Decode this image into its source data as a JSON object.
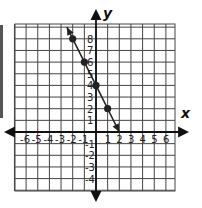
{
  "chart_data": {
    "type": "line",
    "title": "",
    "xlabel": "x",
    "ylabel": "y",
    "xlim": [
      -7,
      7
    ],
    "ylim": [
      -5,
      9
    ],
    "grid": true,
    "x_tick_labels": [
      "-6",
      "-5",
      "-4",
      "-3",
      "-2",
      "-1",
      "1",
      "2",
      "3",
      "4",
      "5",
      "6"
    ],
    "x_ticks": [
      -6,
      -5,
      -4,
      -3,
      -2,
      -1,
      1,
      2,
      3,
      4,
      5,
      6
    ],
    "y_tick_labels": [
      "8",
      "7",
      "6",
      "5",
      "4",
      "3",
      "2",
      "1",
      "-1",
      "-2",
      "-3",
      "-4"
    ],
    "y_ticks": [
      8,
      7,
      6,
      5,
      4,
      3,
      2,
      1,
      -1,
      -2,
      -3,
      -4
    ],
    "series": [
      {
        "name": "line",
        "equation": "y = -2x + 4",
        "points": [
          {
            "x": -2,
            "y": 8
          },
          {
            "x": -1,
            "y": 6
          },
          {
            "x": 0,
            "y": 4
          },
          {
            "x": 1,
            "y": 2
          }
        ],
        "line_start": {
          "x": -2.5,
          "y": 9
        },
        "line_end": {
          "x": 2,
          "y": 0
        },
        "color": "#222222"
      }
    ]
  },
  "axes": {
    "x_name": "x",
    "y_name": "y"
  }
}
